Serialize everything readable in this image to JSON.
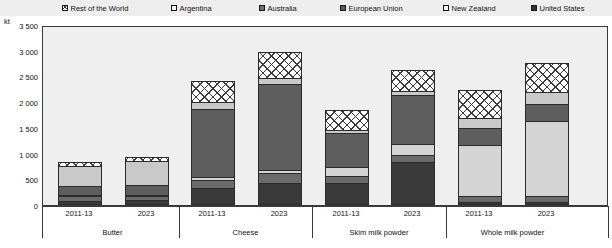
{
  "legend": {
    "items": [
      {
        "label": "Rest of the World",
        "key": "row",
        "swatch": "cross-hatch-swatch",
        "color": "#ffffff",
        "x": 62
      },
      {
        "label": "Argentina",
        "key": "arg",
        "swatch": "light-gray-swatch",
        "color": "#d4d4d4",
        "x": 171
      },
      {
        "label": "Australia",
        "key": "aus",
        "swatch": "medium-gray-swatch",
        "color": "#6b6b6b",
        "x": 259
      },
      {
        "label": "European Union",
        "key": "eu",
        "swatch": "dark-gray-swatch",
        "color": "#5e5e5e",
        "x": 340
      },
      {
        "label": "New Zealand",
        "key": "nz",
        "swatch": "pale-gray-swatch",
        "color": "#c9c9c9",
        "x": 443
      },
      {
        "label": "United States",
        "key": "us",
        "swatch": "near-black-swatch",
        "color": "#3a3a3a",
        "x": 531
      }
    ]
  },
  "axis": {
    "unit": "kt",
    "y_ticks": [
      "0",
      "500",
      "1 000",
      "1 500",
      "2 000",
      "2 500",
      "3 000",
      "3 500"
    ],
    "y_min": 0,
    "y_max": 3500,
    "y_step": 500
  },
  "chart_data": {
    "type": "bar",
    "title": "",
    "xlabel": "",
    "ylabel": "kt",
    "ylim": [
      0,
      3500
    ],
    "grid": false,
    "stacked": true,
    "legend_position": "top",
    "categories": [
      "Butter 2011-13",
      "Butter 2023",
      "Cheese 2011-13",
      "Cheese 2023",
      "Skim milk powder 2011-13",
      "Skim milk powder 2023",
      "Whole milk powder 2011-13",
      "Whole milk powder 2023"
    ],
    "groups": [
      {
        "name": "Butter",
        "periods": [
          "2011-13",
          "2023"
        ]
      },
      {
        "name": "Cheese",
        "periods": [
          "2011-13",
          "2023"
        ]
      },
      {
        "name": "Skim milk powder",
        "periods": [
          "2011-13",
          "2023"
        ]
      },
      {
        "name": "Whole milk powder",
        "periods": [
          "2011-13",
          "2023"
        ]
      }
    ],
    "series": [
      {
        "name": "United States",
        "key": "us",
        "color": "#3a3a3a",
        "values": [
          40,
          60,
          290,
          390,
          390,
          790,
          20,
          20
        ]
      },
      {
        "name": "Australia",
        "key": "aus",
        "color": "#6b6b6b",
        "values": [
          90,
          70,
          160,
          190,
          140,
          140,
          110,
          110
        ]
      },
      {
        "name": "Argentina",
        "key": "arg",
        "color": "#d4d4d4",
        "values": [
          30,
          30,
          50,
          60,
          170,
          220,
          990,
          1470
        ]
      },
      {
        "name": "European Union",
        "key": "eu",
        "color": "#5e5e5e",
        "values": [
          170,
          190,
          1320,
          1670,
          660,
          950,
          330,
          320
        ]
      },
      {
        "name": "New Zealand",
        "key": "nz",
        "color": "#c9c9c9",
        "values": [
          400,
          460,
          150,
          120,
          70,
          70,
          210,
          230
        ]
      },
      {
        "name": "Rest of the World",
        "key": "row",
        "color": "#ffffff",
        "values": [
          70,
          80,
          400,
          500,
          370,
          410,
          530,
          580
        ]
      }
    ],
    "totals": [
      800,
      890,
      2370,
      2930,
      1800,
      2580,
      2190,
      2730
    ]
  }
}
